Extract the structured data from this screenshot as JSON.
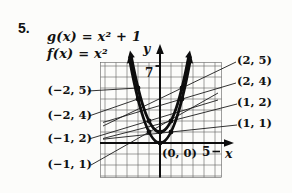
{
  "problem_number": "5.",
  "equations": {
    "g": "g(x) = x² + 1",
    "f": "f(x) = x²"
  },
  "axes": {
    "x_label": "x",
    "y_label": "y",
    "x_tick_label": "5",
    "y_tick_label": "7",
    "origin_label": "(0, 0)"
  },
  "point_labels": {
    "left": [
      {
        "text": "(−2, 5)"
      },
      {
        "text": "(−2, 4)"
      },
      {
        "text": "(−1, 2)"
      },
      {
        "text": "(−1, 1)"
      }
    ],
    "right": [
      {
        "text": "(2, 5)"
      },
      {
        "text": "(2, 4)"
      },
      {
        "text": "(1, 2)"
      },
      {
        "text": "(1, 1)"
      }
    ]
  },
  "colors": {
    "ink": "#111111",
    "grid_line": "#606060",
    "background": "#fcfcfa"
  },
  "chart_data": {
    "type": "line",
    "title": "",
    "xlabel": "x",
    "ylabel": "y",
    "xlim": [
      -5.5,
      6
    ],
    "ylim": [
      -3,
      8
    ],
    "grid": true,
    "legend_position": "none",
    "series": [
      {
        "name": "g(x) = x² + 1",
        "points": [
          [
            -2,
            5
          ],
          [
            -1,
            2
          ],
          [
            0,
            1
          ],
          [
            1,
            2
          ],
          [
            2,
            5
          ]
        ]
      },
      {
        "name": "f(x) = x²",
        "points": [
          [
            -2,
            4
          ],
          [
            -1,
            1
          ],
          [
            0,
            0
          ],
          [
            1,
            1
          ],
          [
            2,
            4
          ]
        ]
      }
    ]
  }
}
